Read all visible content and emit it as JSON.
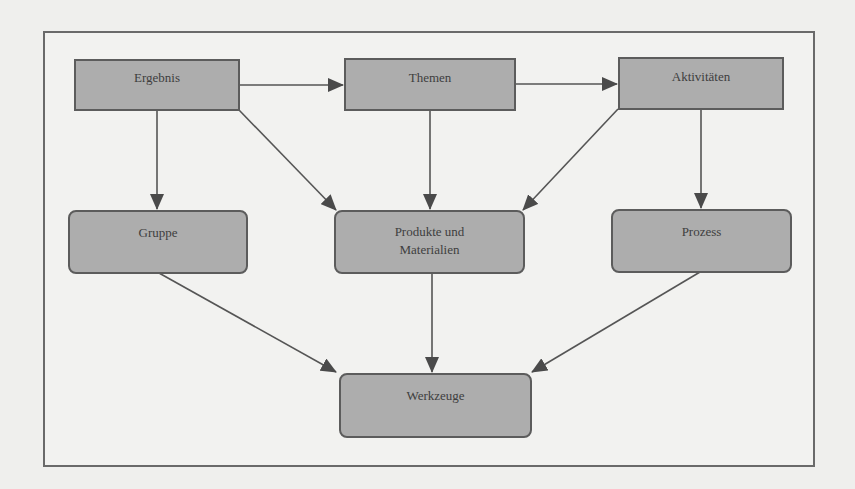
{
  "diagram": {
    "type": "flowchart",
    "colors": {
      "background": "#efefed",
      "node_fill": "#adadad",
      "node_border": "#5c5c5c",
      "edge": "#555555",
      "text": "#3e3e3e"
    },
    "nodes": {
      "ergebnis": {
        "label": "Ergebnis",
        "shape": "rectangle"
      },
      "themen": {
        "label": "Themen",
        "shape": "rectangle"
      },
      "aktivitaeten": {
        "label": "Aktivitäten",
        "shape": "rectangle"
      },
      "gruppe": {
        "label": "Gruppe",
        "shape": "rounded-rectangle"
      },
      "produkte": {
        "label_line1": "Produkte und",
        "label_line2": "Materialien",
        "shape": "rounded-rectangle"
      },
      "prozess": {
        "label": "Prozess",
        "shape": "rounded-rectangle"
      },
      "werkzeuge": {
        "label": "Werkzeuge",
        "shape": "rounded-rectangle"
      }
    },
    "edges": [
      {
        "from": "Ergebnis",
        "to": "Themen"
      },
      {
        "from": "Themen",
        "to": "Aktivitäten"
      },
      {
        "from": "Ergebnis",
        "to": "Gruppe"
      },
      {
        "from": "Ergebnis",
        "to": "Produkte und Materialien"
      },
      {
        "from": "Themen",
        "to": "Produkte und Materialien"
      },
      {
        "from": "Aktivitäten",
        "to": "Produkte und Materialien"
      },
      {
        "from": "Aktivitäten",
        "to": "Prozess"
      },
      {
        "from": "Gruppe",
        "to": "Werkzeuge"
      },
      {
        "from": "Produkte und Materialien",
        "to": "Werkzeuge"
      },
      {
        "from": "Prozess",
        "to": "Werkzeuge"
      }
    ]
  }
}
